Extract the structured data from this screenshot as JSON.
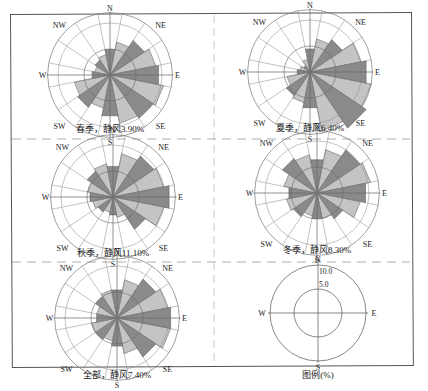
{
  "chart_data": [
    {
      "type": "windrose",
      "title": "春季，静风3.90%",
      "season": "春季",
      "calm_label": "静风",
      "calm_pct": 3.9,
      "directions": [
        "N",
        "NNE",
        "NE",
        "ENE",
        "E",
        "ESE",
        "SE",
        "SSE",
        "S",
        "SSW",
        "SW",
        "WSW",
        "W",
        "WNW",
        "NW",
        "NNW"
      ],
      "values": [
        5.0,
        6.5,
        8.0,
        9.0,
        9.5,
        10.5,
        10.0,
        9.5,
        8.0,
        6.5,
        7.5,
        7.0,
        3.5,
        3.0,
        3.5,
        4.0
      ],
      "compass_labels": [
        "N",
        "NE",
        "E",
        "SE",
        "S",
        "SW",
        "W",
        "NW"
      ],
      "rings": [
        5,
        10
      ],
      "unit": "%"
    },
    {
      "type": "windrose",
      "title": "夏季，静风6.40%",
      "season": "夏季",
      "calm_label": "静风",
      "calm_pct": 6.4,
      "directions": [
        "N",
        "NNE",
        "NE",
        "ENE",
        "E",
        "ESE",
        "SE",
        "SSE",
        "S",
        "SSW",
        "SW",
        "WSW",
        "W",
        "WNW",
        "NW",
        "NNW"
      ],
      "values": [
        4.5,
        6.5,
        7.5,
        10.0,
        11.0,
        12.0,
        13.0,
        11.5,
        7.0,
        6.0,
        5.5,
        4.5,
        2.5,
        2.0,
        1.5,
        2.5
      ],
      "compass_labels": [
        "N",
        "NE",
        "E",
        "SE",
        "S",
        "SW",
        "W",
        "NW"
      ],
      "rings": [
        5,
        10
      ],
      "unit": "%"
    },
    {
      "type": "windrose",
      "title": "秋季，静风11.10%",
      "season": "秋季",
      "calm_label": "静风",
      "calm_pct": 11.1,
      "directions": [
        "N",
        "NNE",
        "NE",
        "ENE",
        "E",
        "ESE",
        "SE",
        "SSE",
        "S",
        "SSW",
        "SW",
        "WSW",
        "W",
        "WNW",
        "NW",
        "NNW"
      ],
      "values": [
        6.0,
        8.5,
        9.5,
        10.0,
        11.0,
        10.0,
        7.5,
        4.0,
        3.5,
        3.0,
        3.5,
        4.0,
        4.5,
        5.0,
        6.0,
        6.5
      ],
      "compass_labels": [
        "N",
        "NE",
        "E",
        "SE",
        "S",
        "SW",
        "W",
        "NW"
      ],
      "rings": [
        5,
        10
      ],
      "unit": "%"
    },
    {
      "type": "windrose",
      "title": "冬季，静风8.30%",
      "season": "冬季",
      "calm_label": "静风",
      "calm_pct": 8.3,
      "directions": [
        "N",
        "NNE",
        "NE",
        "ENE",
        "E",
        "ESE",
        "SE",
        "SSE",
        "S",
        "SSW",
        "SW",
        "WSW",
        "W",
        "WNW",
        "NW",
        "NNW"
      ],
      "values": [
        6.5,
        8.5,
        10.0,
        10.5,
        9.5,
        8.5,
        6.0,
        5.0,
        5.0,
        4.5,
        5.5,
        6.0,
        5.5,
        6.5,
        8.0,
        7.5
      ],
      "compass_labels": [
        "N",
        "NE",
        "E",
        "SE",
        "S",
        "SW",
        "W",
        "NW"
      ],
      "rings": [
        5,
        10
      ],
      "unit": "%"
    },
    {
      "type": "windrose",
      "title": "全部，静风7.40%",
      "season": "全部",
      "calm_label": "静风",
      "calm_pct": 7.4,
      "directions": [
        "N",
        "NNE",
        "NE",
        "ENE",
        "E",
        "ESE",
        "SE",
        "SSE",
        "S",
        "SSW",
        "SW",
        "WSW",
        "W",
        "WNW",
        "NW",
        "NNW"
      ],
      "values": [
        5.5,
        7.5,
        9.0,
        10.0,
        10.5,
        10.5,
        9.0,
        7.0,
        5.5,
        4.5,
        5.0,
        5.0,
        4.0,
        4.0,
        5.0,
        5.5
      ],
      "compass_labels": [
        "N",
        "NE",
        "E",
        "SE",
        "S",
        "SW",
        "W",
        "NW"
      ],
      "rings": [
        5,
        10
      ],
      "unit": "%"
    },
    {
      "type": "legend",
      "title": "图例(%)",
      "ring_labels": [
        "10.0",
        "5.0"
      ],
      "rings": [
        5,
        10
      ],
      "compass_labels": [
        "N",
        "E",
        "S",
        "W"
      ]
    }
  ]
}
